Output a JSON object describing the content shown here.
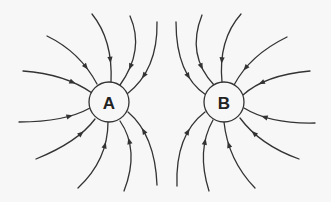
{
  "diagram": {
    "title": "",
    "type": "electric-field-lines",
    "colors": {
      "line": "#333333",
      "background": "#f7f7f7",
      "label": "#222222"
    },
    "charges": [
      {
        "id": "A",
        "label": "A",
        "cx": 109,
        "cy": 102,
        "r": 20,
        "field_direction": "inward"
      },
      {
        "id": "B",
        "label": "B",
        "cx": 224,
        "cy": 102,
        "r": 20,
        "field_direction": "inward"
      }
    ],
    "field_lines": [
      {
        "charge": "A",
        "d": "M23,71 Q65,74 92,93",
        "arrow": [
          72,
          83
        ]
      },
      {
        "charge": "A",
        "d": "M47,36 Q80,52 97,84",
        "arrow": [
          86,
          67
        ]
      },
      {
        "charge": "A",
        "d": "M92,14 Q113,40 111,82",
        "arrow": [
          112,
          60
        ]
      },
      {
        "charge": "A",
        "d": "M130,16 Q145,50 120,85",
        "arrow": [
          135,
          68
        ]
      },
      {
        "charge": "A",
        "d": "M157,22 Q158,70 127,94",
        "arrow": [
          148,
          78
        ]
      },
      {
        "charge": "A",
        "d": "M19,122 Q65,122 90,108",
        "arrow": [
          70,
          117
        ]
      },
      {
        "charge": "A",
        "d": "M36,159 Q78,142 95,119",
        "arrow": [
          81,
          134
        ]
      },
      {
        "charge": "A",
        "d": "M78,188 Q108,160 108,122",
        "arrow": [
          107,
          146
        ]
      },
      {
        "charge": "A",
        "d": "M124,191 Q140,150 120,121",
        "arrow": [
          133,
          140
        ]
      },
      {
        "charge": "A",
        "d": "M157,185 Q155,135 128,112",
        "arrow": [
          147,
          129
        ]
      },
      {
        "charge": "B",
        "d": "M176,22 Q176,75 206,95",
        "arrow": [
          186,
          77
        ]
      },
      {
        "charge": "B",
        "d": "M202,15 Q186,55 214,85",
        "arrow": [
          198,
          68
        ]
      },
      {
        "charge": "B",
        "d": "M241,14 Q218,40 222,82",
        "arrow": [
          221,
          60
        ]
      },
      {
        "charge": "B",
        "d": "M287,37 Q250,55 234,85",
        "arrow": [
          246,
          68
        ]
      },
      {
        "charge": "B",
        "d": "M310,71 Q265,75 243,95",
        "arrow": [
          262,
          84
        ]
      },
      {
        "charge": "B",
        "d": "M315,123 Q270,124 244,108",
        "arrow": [
          265,
          117
        ]
      },
      {
        "charge": "B",
        "d": "M299,159 Q260,145 240,118",
        "arrow": [
          254,
          133
        ]
      },
      {
        "charge": "B",
        "d": "M255,188 Q228,160 224,122",
        "arrow": [
          226,
          146
        ]
      },
      {
        "charge": "B",
        "d": "M209,191 Q196,150 213,120",
        "arrow": [
          201,
          141
        ]
      },
      {
        "charge": "B",
        "d": "M177,186 Q175,135 205,112",
        "arrow": [
          185,
          130
        ]
      }
    ]
  }
}
